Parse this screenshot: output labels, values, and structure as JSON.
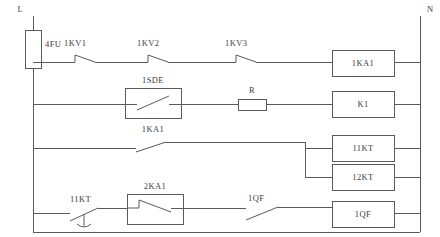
{
  "diagram": {
    "type": "electrical-ladder-schematic",
    "line_color": "#5a5a5a",
    "text_color": "#3d3d3d",
    "background": "#ffffff"
  },
  "rails": {
    "left": {
      "label": "L",
      "x": 33
    },
    "right": {
      "label": "N",
      "x": 420
    }
  },
  "fuse": {
    "label": "4FU",
    "type": "fuse"
  },
  "rungs": [
    {
      "id": "rung-1",
      "y": 62,
      "contacts": [
        {
          "label": "1KV1",
          "type": "normally-closed"
        },
        {
          "label": "1KV2",
          "type": "normally-closed"
        },
        {
          "label": "1KV3",
          "type": "normally-closed"
        }
      ],
      "coil": {
        "label": "1KA1"
      }
    },
    {
      "id": "rung-2",
      "y": 104,
      "contacts": [
        {
          "label": "1SDE",
          "sub_label": "1KA1",
          "type": "normally-open-boxed"
        }
      ],
      "components": [
        {
          "label": "R",
          "type": "resistor"
        }
      ],
      "coil": {
        "label": "K1"
      }
    },
    {
      "id": "rung-3",
      "y": 148,
      "contacts": [
        {
          "label": "",
          "type": "normally-open"
        }
      ],
      "coil": {
        "label": "11KT"
      },
      "branch_coil": {
        "label": "12KT"
      }
    },
    {
      "id": "rung-4",
      "y": 213,
      "contacts": [
        {
          "label": "11KT",
          "type": "delay-normally-closed"
        },
        {
          "label": "2KA1",
          "type": "normally-closed-boxed"
        },
        {
          "label": "1QF",
          "type": "normally-open"
        }
      ],
      "coil": {
        "label": "1QF"
      }
    }
  ],
  "coil_boxes": [
    {
      "label": "1KA1",
      "x": 332,
      "y": 50,
      "w": 62,
      "h": 26
    },
    {
      "label": "K1",
      "x": 332,
      "y": 91,
      "w": 62,
      "h": 26
    },
    {
      "label": "11KT",
      "x": 332,
      "y": 135,
      "w": 62,
      "h": 26
    },
    {
      "label": "12KT",
      "x": 332,
      "y": 164,
      "w": 62,
      "h": 26
    },
    {
      "label": "1QF",
      "x": 332,
      "y": 201,
      "w": 62,
      "h": 26
    }
  ]
}
